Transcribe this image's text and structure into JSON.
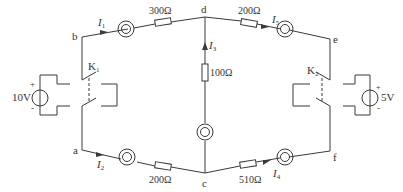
{
  "diagram": {
    "type": "circuit",
    "nodes": {
      "a": "a",
      "b": "b",
      "c": "c",
      "d": "d",
      "e": "e",
      "f": "f"
    },
    "sources": {
      "left": {
        "value": "10V",
        "plus": "+",
        "minus": "-"
      },
      "right": {
        "value": "5V",
        "plus": "+",
        "minus": "-"
      }
    },
    "switches": {
      "k1": {
        "letter": "K",
        "sub": "1"
      },
      "k2": {
        "letter": "K",
        "sub": "2"
      }
    },
    "resistors": {
      "bd": "300Ω",
      "de": "200Ω",
      "dc": "100Ω",
      "ac": "200Ω",
      "cf": "510Ω"
    },
    "currents": {
      "i1": {
        "letter": "I",
        "sub": "1"
      },
      "i2": {
        "letter": "I",
        "sub": "2"
      },
      "i3": {
        "letter": "I",
        "sub": "3"
      },
      "i4": {
        "letter": "I",
        "sub": "4"
      },
      "i5": {
        "letter": "I",
        "sub": "5"
      }
    },
    "colors": {
      "wire": "#3a3a3a",
      "background": "#ffffff"
    }
  }
}
